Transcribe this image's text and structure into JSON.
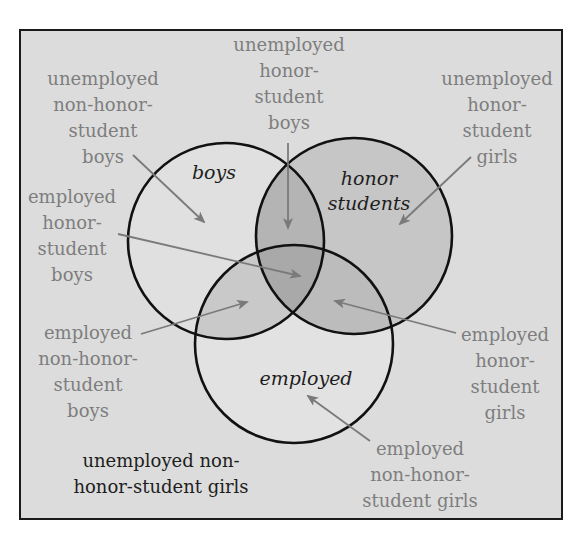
{
  "diagram": {
    "type": "venn",
    "colors": {
      "frame_border": "#1a1a1a",
      "background": "#dcdcdc",
      "circle_stroke": "#111111",
      "boys_only_fill": "#e0e0e0",
      "honor_fill": "#c6c6c6",
      "employed_only_fill": "#e2e2e2",
      "boys_employed_fill": "#c9c9c9",
      "boys_honor_fill": "#b4b4b4",
      "honor_employed_fill": "#bcbcbc",
      "triple_fill": "#a9a9a9",
      "label_gray": "#7e7e7e",
      "label_dark": "#1e1e1e",
      "arrow": "#7a7a7a"
    },
    "sets": [
      {
        "id": "boys",
        "name_lines": [
          "boys"
        ],
        "cx": 226,
        "cy": 241,
        "r": 98,
        "name_x": 214,
        "name_y": 160
      },
      {
        "id": "honor",
        "name_lines": [
          "honor",
          "students"
        ],
        "cx": 354,
        "cy": 236,
        "r": 98,
        "name_x": 369,
        "name_y": 166
      },
      {
        "id": "employed",
        "name_lines": [
          "employed"
        ],
        "cx": 294,
        "cy": 344,
        "r": 99,
        "name_x": 306,
        "name_y": 366
      }
    ],
    "labels": [
      {
        "id": "unemployed-non-honor-student-boys",
        "lines": [
          "unemployed",
          "non-honor-",
          "student",
          "boys"
        ],
        "x": 103,
        "y": 66,
        "style": "gray",
        "arrow": {
          "x1": 133,
          "y1": 155,
          "x2": 204,
          "y2": 222
        }
      },
      {
        "id": "unemployed-honor-student-boys",
        "lines": [
          "unemployed",
          "honor-",
          "student",
          "boys"
        ],
        "x": 289,
        "y": 32,
        "style": "gray",
        "arrow": {
          "x1": 288,
          "y1": 143,
          "x2": 288,
          "y2": 228
        }
      },
      {
        "id": "unemployed-honor-student-girls",
        "lines": [
          "unemployed",
          "honor-",
          "student",
          "girls"
        ],
        "x": 497,
        "y": 66,
        "style": "gray",
        "arrow": {
          "x1": 471,
          "y1": 157,
          "x2": 400,
          "y2": 224
        }
      },
      {
        "id": "employed-honor-student-boys",
        "lines": [
          "employed",
          "honor-",
          "student",
          "boys"
        ],
        "x": 72,
        "y": 184,
        "style": "gray",
        "arrow": {
          "x1": 118,
          "y1": 234,
          "x2": 300,
          "y2": 276
        }
      },
      {
        "id": "employed-non-honor-student-boys",
        "lines": [
          "employed",
          "non-honor-",
          "student",
          "boys"
        ],
        "x": 88,
        "y": 320,
        "style": "gray",
        "arrow": {
          "x1": 141,
          "y1": 334,
          "x2": 247,
          "y2": 302
        }
      },
      {
        "id": "employed-honor-student-girls",
        "lines": [
          "employed",
          "honor-",
          "student",
          "girls"
        ],
        "x": 505,
        "y": 322,
        "style": "gray",
        "arrow": {
          "x1": 456,
          "y1": 333,
          "x2": 335,
          "y2": 301
        }
      },
      {
        "id": "employed-non-honor-student-girls",
        "lines": [
          "employed",
          "non-honor-",
          "student girls"
        ],
        "x": 420,
        "y": 436,
        "style": "gray",
        "arrow": {
          "x1": 370,
          "y1": 441,
          "x2": 308,
          "y2": 396
        }
      },
      {
        "id": "unemployed-non-honor-student-girls",
        "lines": [
          "unemployed non-",
          "honor-student girls"
        ],
        "x": 161,
        "y": 448,
        "style": "dark",
        "arrow": null
      }
    ]
  }
}
